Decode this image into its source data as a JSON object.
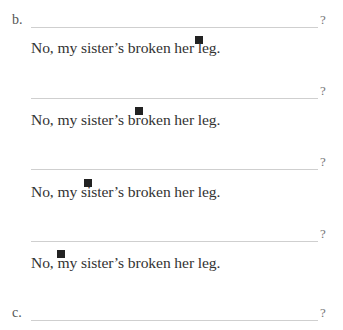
{
  "exercise_b": {
    "label": "b.",
    "items": [
      {
        "blank_question_mark": "?",
        "answer": "No, my sister’s broken her leg.",
        "marker_position": "before 'leg'"
      },
      {
        "blank_question_mark": "?",
        "answer": "No, my sister’s broken her leg.",
        "marker_position": "before 'broken'"
      },
      {
        "blank_question_mark": "?",
        "answer": "No, my sister’s broken her leg.",
        "marker_position": "before 'sister’s'"
      },
      {
        "blank_question_mark": "?",
        "answer": "No, my sister’s broken her leg.",
        "marker_position": "before 'my'"
      }
    ]
  },
  "exercise_c": {
    "label": "c.",
    "blank_question_mark": "?"
  },
  "colors": {
    "text": "#333333",
    "line": "#cfcfcf",
    "marker": "#222222"
  }
}
